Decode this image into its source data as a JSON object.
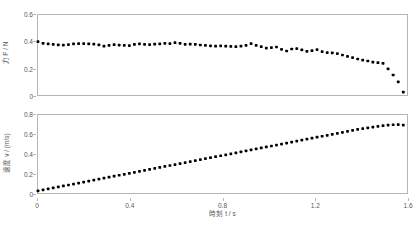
{
  "figure": {
    "background_color": "#ffffff",
    "marker_color": "#000000",
    "axis_color": "#b6b6b6",
    "tick_text_color": "#595959"
  },
  "chart_data": [
    {
      "type": "scatter",
      "id": "force-vs-time",
      "title": "",
      "xlabel": "",
      "ylabel": "力 F / N",
      "xlim": [
        0,
        1.6
      ],
      "ylim": [
        0,
        0.6
      ],
      "xticks": [],
      "xtick_labels": [],
      "yticks": [
        0,
        0.2,
        0.4,
        0.6
      ],
      "ytick_labels": [
        "0",
        "0.2",
        "0.4",
        "0.6"
      ],
      "grid": false,
      "legend": false,
      "x": [
        0.0,
        0.022,
        0.044,
        0.066,
        0.088,
        0.11,
        0.132,
        0.154,
        0.176,
        0.198,
        0.22,
        0.242,
        0.264,
        0.286,
        0.308,
        0.33,
        0.352,
        0.374,
        0.396,
        0.418,
        0.44,
        0.462,
        0.484,
        0.506,
        0.528,
        0.55,
        0.572,
        0.594,
        0.616,
        0.638,
        0.66,
        0.682,
        0.704,
        0.726,
        0.748,
        0.77,
        0.792,
        0.814,
        0.836,
        0.858,
        0.88,
        0.902,
        0.924,
        0.946,
        0.968,
        0.99,
        1.012,
        1.034,
        1.056,
        1.078,
        1.1,
        1.122,
        1.144,
        1.166,
        1.188,
        1.21,
        1.232,
        1.254,
        1.276,
        1.298,
        1.32,
        1.342,
        1.364,
        1.386,
        1.408,
        1.43,
        1.452,
        1.474,
        1.496,
        1.518,
        1.54,
        1.562,
        1.584
      ],
      "y": [
        0.4,
        0.388,
        0.383,
        0.38,
        0.376,
        0.374,
        0.378,
        0.383,
        0.385,
        0.385,
        0.383,
        0.382,
        0.376,
        0.366,
        0.372,
        0.377,
        0.374,
        0.372,
        0.371,
        0.379,
        0.384,
        0.38,
        0.378,
        0.381,
        0.384,
        0.387,
        0.386,
        0.392,
        0.388,
        0.38,
        0.381,
        0.38,
        0.375,
        0.372,
        0.368,
        0.366,
        0.369,
        0.366,
        0.364,
        0.362,
        0.366,
        0.372,
        0.386,
        0.372,
        0.362,
        0.352,
        0.356,
        0.36,
        0.342,
        0.33,
        0.345,
        0.348,
        0.338,
        0.328,
        0.332,
        0.34,
        0.326,
        0.318,
        0.316,
        0.31,
        0.3,
        0.289,
        0.281,
        0.27,
        0.262,
        0.255,
        0.246,
        0.242,
        0.238,
        0.196,
        0.15,
        0.098,
        0.022
      ]
    },
    {
      "type": "scatter",
      "id": "velocity-vs-time",
      "title": "",
      "xlabel": "時刻 t / s",
      "ylabel": "速度 v / (m/s)",
      "xlim": [
        0,
        1.6
      ],
      "ylim": [
        0,
        0.8
      ],
      "xticks": [
        0,
        0.4,
        0.8,
        1.2,
        1.6
      ],
      "xtick_labels": [
        "0",
        "0.4",
        "0.8",
        "1.2",
        "1.6"
      ],
      "yticks": [
        0,
        0.2,
        0.4,
        0.6,
        0.8
      ],
      "ytick_labels": [
        "0",
        "0.2",
        "0.4",
        "0.6",
        "0.8"
      ],
      "grid": false,
      "legend": false,
      "x": [
        0.0,
        0.022,
        0.044,
        0.066,
        0.088,
        0.11,
        0.132,
        0.154,
        0.176,
        0.198,
        0.22,
        0.242,
        0.264,
        0.286,
        0.308,
        0.33,
        0.352,
        0.374,
        0.396,
        0.418,
        0.44,
        0.462,
        0.484,
        0.506,
        0.528,
        0.55,
        0.572,
        0.594,
        0.616,
        0.638,
        0.66,
        0.682,
        0.704,
        0.726,
        0.748,
        0.77,
        0.792,
        0.814,
        0.836,
        0.858,
        0.88,
        0.902,
        0.924,
        0.946,
        0.968,
        0.99,
        1.012,
        1.034,
        1.056,
        1.078,
        1.1,
        1.122,
        1.144,
        1.166,
        1.188,
        1.21,
        1.232,
        1.254,
        1.276,
        1.298,
        1.32,
        1.342,
        1.364,
        1.386,
        1.408,
        1.43,
        1.452,
        1.474,
        1.496,
        1.518,
        1.54,
        1.562,
        1.584
      ],
      "y": [
        0.022,
        0.032,
        0.042,
        0.052,
        0.062,
        0.072,
        0.082,
        0.092,
        0.102,
        0.112,
        0.122,
        0.132,
        0.142,
        0.152,
        0.162,
        0.172,
        0.182,
        0.192,
        0.202,
        0.212,
        0.222,
        0.232,
        0.242,
        0.252,
        0.262,
        0.272,
        0.282,
        0.292,
        0.302,
        0.312,
        0.322,
        0.332,
        0.342,
        0.352,
        0.362,
        0.372,
        0.382,
        0.392,
        0.402,
        0.412,
        0.422,
        0.432,
        0.442,
        0.452,
        0.462,
        0.472,
        0.482,
        0.492,
        0.502,
        0.512,
        0.522,
        0.532,
        0.542,
        0.552,
        0.562,
        0.572,
        0.582,
        0.592,
        0.602,
        0.612,
        0.622,
        0.632,
        0.642,
        0.652,
        0.66,
        0.668,
        0.676,
        0.684,
        0.69,
        0.696,
        0.7,
        0.702,
        0.696
      ]
    }
  ]
}
